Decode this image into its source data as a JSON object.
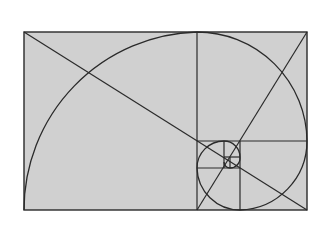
{
  "diagram": {
    "colors": {
      "fill": "#d0d0d0",
      "stroke": "#2a2a2a",
      "background": "#ffffff"
    },
    "outer_rect": {
      "x": 24,
      "y": 32,
      "w": 283,
      "h": 178
    },
    "subdivisions": [
      {
        "type": "vline",
        "x": 197,
        "y1": 32,
        "y2": 210
      },
      {
        "type": "hline",
        "y": 141,
        "x1": 197,
        "x2": 307
      },
      {
        "type": "vline",
        "x": 240,
        "y1": 141,
        "y2": 210
      },
      {
        "type": "hline",
        "y": 168,
        "x1": 197,
        "x2": 240
      },
      {
        "type": "vline",
        "x": 224,
        "y1": 141,
        "y2": 168
      },
      {
        "type": "hline",
        "y": 157,
        "x1": 224,
        "x2": 240
      },
      {
        "type": "vline",
        "x": 230,
        "y1": 157,
        "y2": 168
      }
    ],
    "diagonals": [
      {
        "x1": 24,
        "y1": 32,
        "x2": 307,
        "y2": 210
      },
      {
        "x1": 307,
        "y1": 32,
        "x2": 197,
        "y2": 210
      }
    ]
  }
}
